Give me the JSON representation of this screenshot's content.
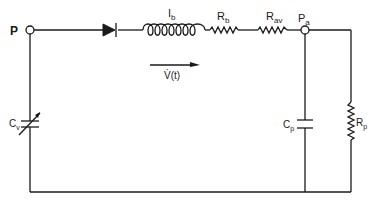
{
  "diagram": {
    "type": "circuit-schematic",
    "nodes": {
      "p": {
        "label": "P"
      },
      "pa": {
        "label": "P",
        "sub": "a"
      }
    },
    "components": {
      "diode": {
        "label": "",
        "type": "diode"
      },
      "inductor": {
        "label": "I",
        "sub": "b",
        "type": "inductor"
      },
      "rb": {
        "label": "R",
        "sub": "b",
        "type": "resistor"
      },
      "rav": {
        "label": "R",
        "sub": "av",
        "type": "resistor"
      },
      "cv": {
        "label": "C",
        "sub": "v",
        "type": "variable-capacitor"
      },
      "cp": {
        "label": "C",
        "sub": "p",
        "type": "capacitor"
      },
      "rp": {
        "label": "R",
        "sub": "p",
        "type": "resistor"
      }
    },
    "flow": {
      "label": "V̇(t)",
      "direction": "right"
    },
    "colors": {
      "line": "#1a1a1a",
      "background": "#ffffff"
    }
  }
}
